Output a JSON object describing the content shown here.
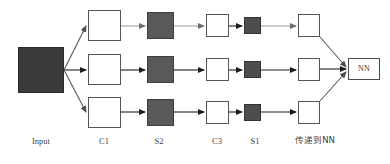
{
  "diagram": {
    "background_color": "#ffffff",
    "stage_labels": [
      {
        "id": "input",
        "text": "Input",
        "x": 14,
        "y": 137,
        "width": 54,
        "cjk": false
      },
      {
        "id": "c1",
        "text": "C1",
        "x": 86,
        "y": 137,
        "width": 36,
        "cjk": false
      },
      {
        "id": "s2",
        "text": "S2",
        "x": 141,
        "y": 137,
        "width": 36,
        "cjk": false
      },
      {
        "id": "c3",
        "text": "C3",
        "x": 200,
        "y": 137,
        "width": 34,
        "cjk": false
      },
      {
        "id": "s1",
        "text": "S1",
        "x": 239,
        "y": 137,
        "width": 32,
        "cjk": false
      },
      {
        "id": "pass-to-nn",
        "text": "传递到NN",
        "x": 283,
        "y": 136,
        "width": 64,
        "cjk": true
      }
    ],
    "nodes": [
      {
        "id": "input-block",
        "name": "input-block",
        "style": "filled-dark",
        "x": 18,
        "y": 47,
        "w": 46,
        "h": 46,
        "label": ""
      },
      {
        "id": "c1-row1",
        "name": "c1-node-row1",
        "style": "plain",
        "x": 88,
        "y": 10,
        "w": 33,
        "h": 31,
        "label": ""
      },
      {
        "id": "c1-row2",
        "name": "c1-node-row2",
        "style": "plain",
        "x": 88,
        "y": 54,
        "w": 33,
        "h": 31,
        "label": ""
      },
      {
        "id": "c1-row3",
        "name": "c1-node-row3",
        "style": "plain",
        "x": 88,
        "y": 97,
        "w": 33,
        "h": 31,
        "label": ""
      },
      {
        "id": "s2-row1",
        "name": "s2-node-row1",
        "style": "filled-mid",
        "x": 147,
        "y": 12,
        "w": 27,
        "h": 27,
        "label": ""
      },
      {
        "id": "s2-row2",
        "name": "s2-node-row2",
        "style": "filled-mid",
        "x": 147,
        "y": 56,
        "w": 27,
        "h": 27,
        "label": ""
      },
      {
        "id": "s2-row3",
        "name": "s2-node-row3",
        "style": "filled-mid",
        "x": 147,
        "y": 99,
        "w": 27,
        "h": 27,
        "label": ""
      },
      {
        "id": "c3-row1",
        "name": "c3-node-row1",
        "style": "plain",
        "x": 206,
        "y": 14,
        "w": 23,
        "h": 23,
        "label": ""
      },
      {
        "id": "c3-row2",
        "name": "c3-node-row2",
        "style": "plain",
        "x": 206,
        "y": 58,
        "w": 23,
        "h": 23,
        "label": ""
      },
      {
        "id": "c3-row3",
        "name": "c3-node-row3",
        "style": "plain",
        "x": 206,
        "y": 101,
        "w": 23,
        "h": 23,
        "label": ""
      },
      {
        "id": "s1-row1",
        "name": "s1-node-row1",
        "style": "filled-s1",
        "x": 244,
        "y": 17,
        "w": 17,
        "h": 17,
        "label": ""
      },
      {
        "id": "s1-row2",
        "name": "s1-node-row2",
        "style": "filled-s1",
        "x": 244,
        "y": 61,
        "w": 17,
        "h": 17,
        "label": ""
      },
      {
        "id": "s1-row3",
        "name": "s1-node-row3",
        "style": "filled-s1",
        "x": 244,
        "y": 104,
        "w": 17,
        "h": 17,
        "label": ""
      },
      {
        "id": "out-row1",
        "name": "output-node-row1",
        "style": "plain",
        "x": 298,
        "y": 14,
        "w": 22,
        "h": 23,
        "label": ""
      },
      {
        "id": "out-row2",
        "name": "output-node-row2",
        "style": "plain",
        "x": 298,
        "y": 58,
        "w": 22,
        "h": 23,
        "label": ""
      },
      {
        "id": "out-row3",
        "name": "output-node-row3",
        "style": "plain",
        "x": 298,
        "y": 101,
        "w": 22,
        "h": 23,
        "label": ""
      },
      {
        "id": "nn-box",
        "name": "nn-box",
        "style": "nn",
        "x": 348,
        "y": 58,
        "w": 32,
        "h": 22,
        "label": "NN"
      }
    ],
    "edges": [
      {
        "id": "in-to-c1-top",
        "name": "edge-input-to-c1-row1",
        "x1": 64,
        "y1": 70,
        "x2": 86,
        "y2": 26,
        "color": "#5a5a5a"
      },
      {
        "id": "in-to-c1-mid",
        "name": "edge-input-to-c1-row2",
        "x1": 64,
        "y1": 70,
        "x2": 86,
        "y2": 70,
        "color": "#222222"
      },
      {
        "id": "in-to-c1-bot",
        "name": "edge-input-to-c1-row3",
        "x1": 64,
        "y1": 70,
        "x2": 86,
        "y2": 112,
        "color": "#5a5a5a"
      },
      {
        "id": "c1-s2-top",
        "name": "edge-c1-to-s2-row1",
        "x1": 121,
        "y1": 26,
        "x2": 145,
        "y2": 26,
        "color": "#8a8a8a"
      },
      {
        "id": "c1-s2-mid",
        "name": "edge-c1-to-s2-row2",
        "x1": 121,
        "y1": 70,
        "x2": 145,
        "y2": 70,
        "color": "#1c1c1c"
      },
      {
        "id": "c1-s2-bot",
        "name": "edge-c1-to-s2-row3",
        "x1": 121,
        "y1": 112,
        "x2": 145,
        "y2": 112,
        "color": "#1c1c1c"
      },
      {
        "id": "s2-c3-top",
        "name": "edge-s2-to-c3-row1",
        "x1": 174,
        "y1": 26,
        "x2": 204,
        "y2": 26,
        "color": "#8a8a8a"
      },
      {
        "id": "s2-c3-mid",
        "name": "edge-s2-to-c3-row2",
        "x1": 174,
        "y1": 70,
        "x2": 204,
        "y2": 70,
        "color": "#1c1c1c"
      },
      {
        "id": "s2-c3-bot",
        "name": "edge-s2-to-c3-row3",
        "x1": 174,
        "y1": 112,
        "x2": 204,
        "y2": 112,
        "color": "#1c1c1c"
      },
      {
        "id": "c3-s1-top",
        "name": "edge-c3-to-s1-row1",
        "x1": 229,
        "y1": 26,
        "x2": 242,
        "y2": 26,
        "color": "#1c1c1c"
      },
      {
        "id": "c3-s1-mid",
        "name": "edge-c3-to-s1-row2",
        "x1": 229,
        "y1": 70,
        "x2": 242,
        "y2": 70,
        "color": "#1c1c1c"
      },
      {
        "id": "c3-s1-bot",
        "name": "edge-c3-to-s1-row3",
        "x1": 229,
        "y1": 112,
        "x2": 242,
        "y2": 112,
        "color": "#1c1c1c"
      },
      {
        "id": "s1-out-top",
        "name": "edge-s1-to-output-row1",
        "x1": 261,
        "y1": 26,
        "x2": 296,
        "y2": 26,
        "color": "#8a8a8a"
      },
      {
        "id": "s1-out-mid",
        "name": "edge-s1-to-output-row2",
        "x1": 261,
        "y1": 70,
        "x2": 296,
        "y2": 70,
        "color": "#1c1c1c"
      },
      {
        "id": "s1-out-bot",
        "name": "edge-s1-to-output-row3",
        "x1": 261,
        "y1": 112,
        "x2": 296,
        "y2": 112,
        "color": "#1c1c1c"
      },
      {
        "id": "out-nn-top",
        "name": "edge-output-row1-to-nn",
        "x1": 320,
        "y1": 37,
        "x2": 346,
        "y2": 67,
        "color": "#5a5a5a"
      },
      {
        "id": "out-nn-mid",
        "name": "edge-output-row2-to-nn",
        "x1": 320,
        "y1": 69,
        "x2": 346,
        "y2": 69,
        "color": "#1c1c1c"
      },
      {
        "id": "out-nn-bot",
        "name": "edge-output-row3-to-nn",
        "x1": 320,
        "y1": 101,
        "x2": 346,
        "y2": 72,
        "color": "#5a5a5a"
      }
    ]
  }
}
